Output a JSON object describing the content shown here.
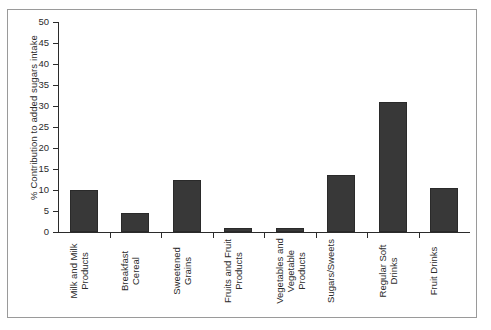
{
  "chart_data": {
    "type": "bar",
    "title": "",
    "subtitle": "",
    "xlabel": "",
    "ylabel": "% Contribution to added sugars intake",
    "ylim": [
      0,
      50
    ],
    "yticks": [
      0,
      5,
      10,
      15,
      20,
      25,
      30,
      35,
      40,
      45,
      50
    ],
    "ytick_labels": [
      "0",
      "5",
      "10",
      "15",
      "20",
      "25",
      "30",
      "35",
      "40",
      "45",
      "50"
    ],
    "grid": false,
    "legend": null,
    "bar_color": "#383838",
    "categories": [
      "Milk and Milk Products",
      "Breakfast Cereal",
      "Sweetened Grains",
      "Fruits and Fruit Products",
      "Vegetables and Vegetable Products",
      "Sugars/Sweets",
      "Regular Soft Drinks",
      "Fruit Drinks"
    ],
    "category_lines": [
      "Milk and Milk\nProducts",
      "Breakfast\nCereal",
      "Sweetened\nGrains",
      "Fruits and Fruit\nProducts",
      "Vegetables and\nVegetable\nProducts",
      "Sugars/Sweets",
      "Regular Soft\nDrinks",
      "Fruit Drinks"
    ],
    "values": [
      10,
      4.5,
      12.5,
      1,
      1,
      13.5,
      31,
      10.5
    ]
  }
}
